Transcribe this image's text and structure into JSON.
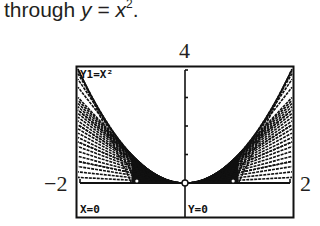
{
  "caption": {
    "prefix": "through ",
    "y_var": "y",
    "equals": " = ",
    "x_var": "x",
    "exponent": "2",
    "suffix": "."
  },
  "axis_labels": {
    "ymax": "4",
    "xmin": "−2",
    "xmax": "2"
  },
  "calculator_screen": {
    "function_label": "Y1=X²",
    "trace_x": "X=0",
    "trace_y": "Y=0"
  },
  "chart_data": {
    "type": "line",
    "function": "y = x^2",
    "window": {
      "xmin": -2,
      "xmax": 2,
      "ymin": 0,
      "ymax": 4
    },
    "y_ticks": [
      1,
      2,
      3
    ],
    "tangent_points_a": [
      -2.0,
      -1.8,
      -1.6,
      -1.4,
      -1.2,
      -1.0,
      -0.8,
      -0.6,
      -0.4,
      -0.2,
      0.2,
      0.4,
      0.6,
      0.8,
      1.0,
      1.2,
      1.4,
      1.6,
      1.8,
      2.0
    ],
    "trace_point": {
      "x": 0,
      "y": 0
    },
    "xlabel": "",
    "ylabel": "",
    "grid": false
  }
}
